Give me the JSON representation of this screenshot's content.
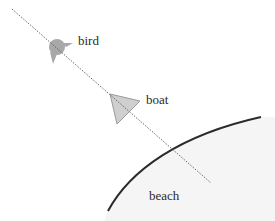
{
  "diagram": {
    "colors": {
      "background": "#ffffff",
      "beach_fill": "#f5f5f5",
      "shore_stroke": "#2b2b2b",
      "sightline": "#666666",
      "bird_fill": "#a8a8a8",
      "boat_fill": "#cfcfcf",
      "boat_stroke": "#9a9a9a",
      "label": "#2a2a2a"
    },
    "sightline": {
      "x1": 12,
      "y1": 9,
      "x2": 211,
      "y2": 183,
      "style": "dotted"
    },
    "objects": [
      {
        "id": "bird",
        "label": "bird",
        "shape": "bird-silhouette",
        "cx": 57,
        "cy": 47,
        "label_x": 78,
        "label_y": 45
      },
      {
        "id": "boat",
        "label": "boat",
        "shape": "triangle",
        "points": "110,94 140,101 117,124",
        "label_x": 146,
        "label_y": 104
      },
      {
        "id": "beach",
        "label": "beach",
        "shape": "shore-region",
        "label_x": 149,
        "label_y": 200
      }
    ]
  }
}
